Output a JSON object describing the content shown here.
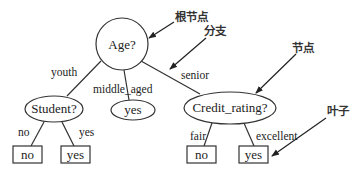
{
  "diagram": {
    "type": "decision-tree",
    "nodes": {
      "root": {
        "label": "Age?",
        "shape": "circle"
      },
      "student": {
        "label": "Student?",
        "shape": "ellipse"
      },
      "middle_leaf": {
        "label": "yes",
        "shape": "ellipse"
      },
      "credit": {
        "label": "Credit_rating?",
        "shape": "ellipse"
      },
      "leaf_student_no": {
        "label": "no",
        "shape": "box"
      },
      "leaf_student_yes": {
        "label": "yes",
        "shape": "box"
      },
      "leaf_credit_fair": {
        "label": "no",
        "shape": "box"
      },
      "leaf_credit_excellent": {
        "label": "yes",
        "shape": "box"
      }
    },
    "edges": {
      "root_youth": "youth",
      "root_middle": "middle_aged",
      "root_senior": "senior",
      "student_no": "no",
      "student_yes": "yes",
      "credit_fair": "fair",
      "credit_excellent": "excellent"
    },
    "annotations": {
      "root_node": "根节点",
      "branch": "分支",
      "node": "节点",
      "leaf": "叶子"
    },
    "colors": {
      "stroke": "#333333",
      "text": "#222222",
      "background": "#ffffff"
    }
  }
}
